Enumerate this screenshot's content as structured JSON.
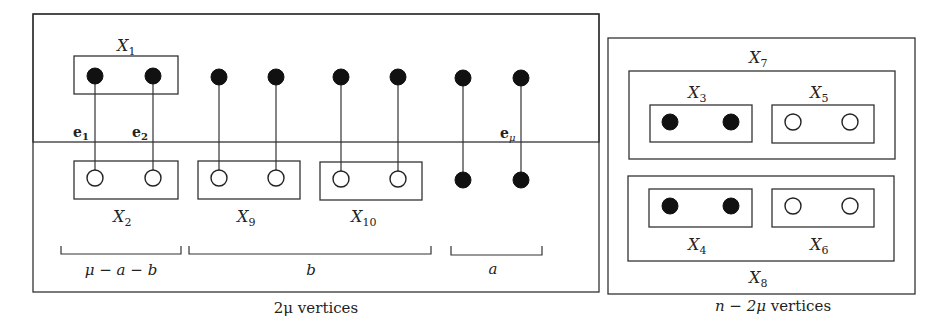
{
  "figure": {
    "left_panel": {
      "caption_count": "2μ",
      "caption_text": " vertices",
      "sets": {
        "X1": {
          "name": "X",
          "sub": "1"
        },
        "X2": {
          "name": "X",
          "sub": "2"
        },
        "X9": {
          "name": "X",
          "sub": "9"
        },
        "X10": {
          "name": "X",
          "sub": "10"
        }
      },
      "edges": {
        "e1": {
          "name": "e",
          "sub": "1"
        },
        "e2": {
          "name": "e",
          "sub": "2"
        },
        "emu": {
          "name": "e",
          "sub": "μ"
        }
      },
      "braces": {
        "first": "μ − a − b",
        "second": "b",
        "third": "a"
      }
    },
    "right_panel": {
      "caption_prefix": "n − 2μ",
      "caption_text": " vertices",
      "sets": {
        "X3": {
          "name": "X",
          "sub": "3"
        },
        "X4": {
          "name": "X",
          "sub": "4"
        },
        "X5": {
          "name": "X",
          "sub": "5"
        },
        "X6": {
          "name": "X",
          "sub": "6"
        },
        "X7": {
          "name": "X",
          "sub": "7"
        },
        "X8": {
          "name": "X",
          "sub": "8"
        }
      }
    },
    "colors": {
      "stroke": "#333333",
      "filled_vertex": "#111111",
      "open_vertex": "#ffffff"
    }
  }
}
